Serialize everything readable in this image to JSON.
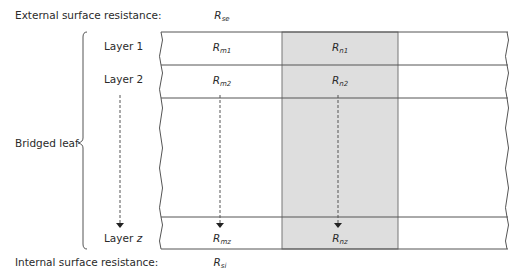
{
  "labels": {
    "external": "External surface resistance:",
    "internal": "Internal surface resistance:",
    "bridged_leaf": "Bridged leaf",
    "layer1": "Layer 1",
    "layer2": "Layer 2",
    "layerz_prefix": "Layer ",
    "layerz_var": "z"
  },
  "resistances": {
    "se": {
      "main": "R",
      "sub": "se"
    },
    "si": {
      "main": "R",
      "sub": "si"
    },
    "m1": {
      "main": "R",
      "sub": "m1"
    },
    "m2": {
      "main": "R",
      "sub": "m2"
    },
    "mz": {
      "main": "R",
      "sub": "mz"
    },
    "n1": {
      "main": "R",
      "sub": "n1"
    },
    "n2": {
      "main": "R",
      "sub": "n2"
    },
    "nz": {
      "main": "R",
      "sub": "nz"
    }
  },
  "colors": {
    "bridge_fill": "#dedede",
    "line": "#555555"
  }
}
